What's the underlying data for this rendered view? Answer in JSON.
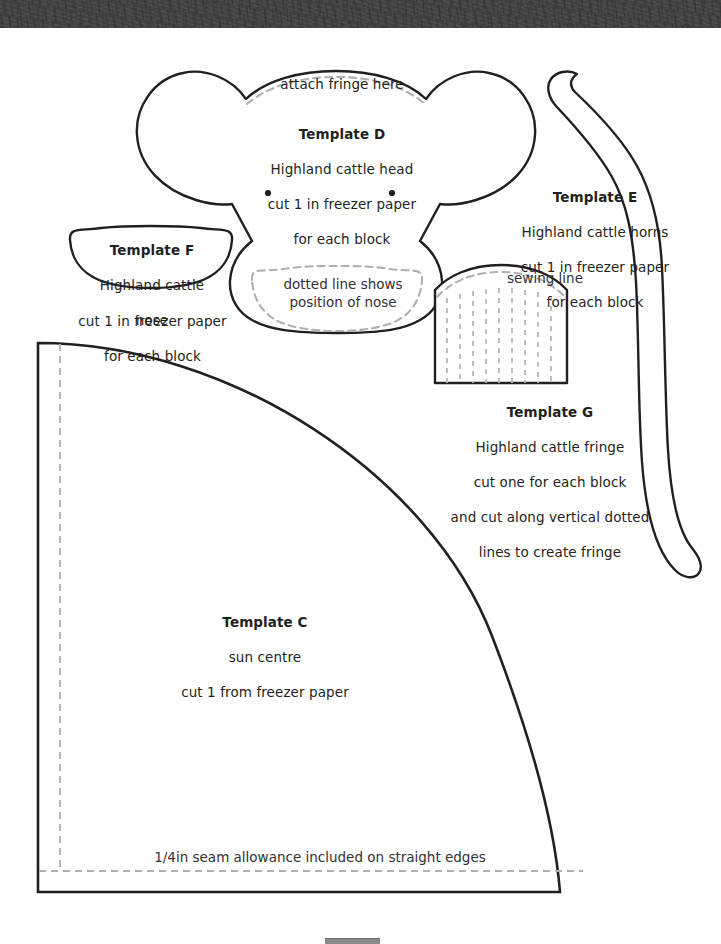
{
  "sheet": {
    "width": 721,
    "height": 944,
    "background": "#ffffff",
    "ink": "#231f20",
    "dash_color": "#b3b3b3",
    "banner_color": "#474747",
    "bottom_bar_color": "#8a8a8a"
  },
  "banner": {
    "name": "textured-header-strip"
  },
  "annotations": {
    "attach_fringe": "attach fringe here",
    "nose_position": "dotted line shows\nposition of nose",
    "sewing_line": "sewing line",
    "seam_allowance": "1/4in seam allowance included on straight edges"
  },
  "templates": [
    {
      "id": "D",
      "title": "Template D",
      "lines": [
        "Highland cattle head",
        "cut 1 in freezer paper",
        "for each block"
      ],
      "shape": "highland-cattle-head"
    },
    {
      "id": "F",
      "title": "Template F",
      "lines": [
        "Highland cattle",
        "nose"
      ],
      "outside_lines": [
        "cut 1 in freezer paper",
        "for each block"
      ],
      "shape": "highland-cattle-nose"
    },
    {
      "id": "E",
      "title": "Template E",
      "lines": [
        "Highland cattle horns",
        "cut 1 in freezer paper",
        "for each block"
      ],
      "shape": "highland-cattle-horns"
    },
    {
      "id": "G",
      "title": "Template G",
      "lines": [
        "Highland cattle fringe",
        "cut one for each block",
        "and cut along vertical dotted",
        "lines to create fringe"
      ],
      "shape": "highland-cattle-fringe"
    },
    {
      "id": "C",
      "title": "Template C",
      "lines": [
        "sun centre",
        "cut 1 from freezer paper"
      ],
      "shape": "sun-centre-quarter-circle"
    }
  ]
}
